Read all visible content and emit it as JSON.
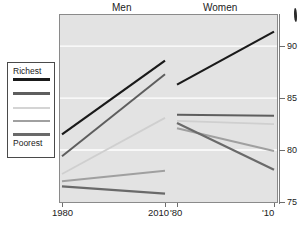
{
  "chart_data": {
    "type": "line",
    "title": "",
    "subtitle": "",
    "xlabel": "",
    "ylabel": "",
    "ylim": [
      75,
      93
    ],
    "yticks": [
      75,
      80,
      85,
      90
    ],
    "ytick_labels": [
      "75",
      "80",
      "85",
      "90"
    ],
    "grid": true,
    "grid_color": "#ffffff",
    "legend_position": "left-outside",
    "panels": [
      {
        "name": "Men",
        "x": [
          1980,
          2010
        ],
        "xtick_labels": [
          "1980",
          "2010"
        ],
        "series": [
          {
            "name": "Richest",
            "color": "#1a1a1a",
            "width": 2.2,
            "values": [
              81.5,
              88.6
            ]
          },
          {
            "name": "Quintile 2",
            "color": "#5e5e5e",
            "width": 2.0,
            "values": [
              79.4,
              87.3
            ]
          },
          {
            "name": "Quintile 3",
            "color": "#cfcfcf",
            "width": 1.8,
            "values": [
              77.7,
              83.1
            ]
          },
          {
            "name": "Quintile 4",
            "color": "#a0a0a0",
            "width": 2.0,
            "values": [
              77.0,
              78.0
            ]
          },
          {
            "name": "Poorest",
            "color": "#6a6a6a",
            "width": 2.2,
            "values": [
              76.5,
              75.8
            ]
          }
        ]
      },
      {
        "name": "Women",
        "x": [
          1980,
          2010
        ],
        "xtick_labels": [
          "'80",
          "'10"
        ],
        "series": [
          {
            "name": "Richest",
            "color": "#1a1a1a",
            "width": 2.2,
            "values": [
              86.3,
              91.4
            ]
          },
          {
            "name": "Quintile 2",
            "color": "#5e5e5e",
            "width": 2.0,
            "values": [
              83.4,
              83.3
            ]
          },
          {
            "name": "Quintile 3",
            "color": "#cfcfcf",
            "width": 1.8,
            "values": [
              82.8,
              82.5
            ]
          },
          {
            "name": "Quintile 4",
            "color": "#a0a0a0",
            "width": 2.0,
            "values": [
              82.1,
              79.9
            ]
          },
          {
            "name": "Poorest",
            "color": "#6a6a6a",
            "width": 2.2,
            "values": [
              82.6,
              78.1
            ]
          }
        ]
      }
    ]
  },
  "panel_titles": {
    "men": "Men",
    "women": "Women"
  },
  "legend": {
    "top_label": "Richest",
    "bottom_label": "Poorest",
    "swatches": [
      {
        "name": "richest-swatch",
        "color": "#1a1a1a",
        "thickness": 3
      },
      {
        "name": "quintile2-swatch",
        "color": "#5e5e5e",
        "thickness": 3
      },
      {
        "name": "quintile3-swatch",
        "color": "#d4d4d4",
        "thickness": 2
      },
      {
        "name": "quintile4-swatch",
        "color": "#a0a0a0",
        "thickness": 2
      },
      {
        "name": "poorest-swatch",
        "color": "#6a6a6a",
        "thickness": 3
      }
    ]
  },
  "axes": {
    "y_tick_labels": [
      "90",
      "85",
      "80",
      "75"
    ],
    "x_tick_labels": [
      "1980",
      "2010",
      "'80",
      "'10"
    ]
  },
  "colors": {
    "plot_background": "#e3e3e3",
    "plot_border": "#8a8a8a",
    "gridline": "#ffffff",
    "axis": "#7d7d7d",
    "text": "#1a1a1a"
  }
}
